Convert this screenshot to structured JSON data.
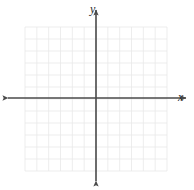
{
  "figure": {
    "kind": "cartesian-coordinate-grid",
    "width": 194,
    "height": 190,
    "background_color": "#ffffff",
    "title": "",
    "caption": ""
  },
  "axis_labels": {
    "x": "x",
    "y": "y"
  },
  "colors": {
    "grid_line": "#e9e9e9",
    "axis_line": "#4a4a4a",
    "label_text": "#2b2b2b",
    "background": "#ffffff"
  },
  "grid": {
    "columns": 12,
    "rows": 12,
    "cell_size_px": 11.83,
    "left_px": 25,
    "right_px": 167,
    "top_px": 27,
    "bottom_px": 171,
    "line_width_px": 0.8,
    "visible": true
  },
  "axes": {
    "origin_x_px": 96,
    "origin_y_px": 98,
    "line_width_px": 1.6,
    "x_axis": {
      "start_px": 8,
      "end_px": 186,
      "arrow_start": true,
      "arrow_end": true
    },
    "y_axis": {
      "start_px": 10,
      "end_px": 181,
      "arrow_start": true,
      "arrow_end": true
    },
    "tick_labels_visible": false,
    "tick_marks_visible": false
  },
  "chart_data": {
    "type": "scatter",
    "title": "",
    "subtitle": "",
    "xlabel": "x",
    "ylabel": "y",
    "xlim": [
      -6,
      6
    ],
    "ylim": [
      -6,
      6
    ],
    "xticks": [
      -6,
      -5,
      -4,
      -3,
      -2,
      -1,
      0,
      1,
      2,
      3,
      4,
      5,
      6
    ],
    "yticks": [
      -6,
      -5,
      -4,
      -3,
      -2,
      -1,
      0,
      1,
      2,
      3,
      4,
      5,
      6
    ],
    "xticklabels": [],
    "yticklabels": [],
    "grid": true,
    "legend": null,
    "legend_position": "none",
    "annotations": [],
    "series": [],
    "x": [],
    "values": [],
    "note": "Empty coordinate plane: 12 by 12 unit grid with labeled x and y axes, no plotted data points or curves."
  }
}
